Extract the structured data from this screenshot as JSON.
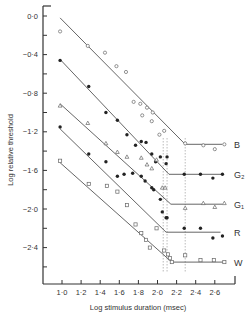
{
  "chart_data": {
    "type": "scatter",
    "title": "",
    "xlabel": "Log stimulus duration (msec)",
    "ylabel": "Log relative threshold",
    "xlim": [
      0.82,
      2.78
    ],
    "ylim": [
      -2.72,
      0.05
    ],
    "x_ticks": [
      "1·0",
      "1·2",
      "1·4",
      "1·6",
      "1·8",
      "2·0",
      "2·2",
      "2·4",
      "2·6"
    ],
    "x_tick_values": [
      1.0,
      1.2,
      1.4,
      1.6,
      1.8,
      2.0,
      2.2,
      2.4,
      2.6
    ],
    "y_ticks": [
      "0·0",
      "−0·4",
      "−0·8",
      "−1·2",
      "−1·6",
      "−2·0",
      "−2·4"
    ],
    "y_tick_values": [
      0.0,
      -0.4,
      -0.8,
      -1.2,
      -1.6,
      -2.0,
      -2.4
    ],
    "grid": false,
    "legend_position": "right, inline labels",
    "reference_lines_x": [
      2.06,
      2.1,
      2.29
    ],
    "series": [
      {
        "name": "B",
        "marker": "open-circle",
        "knee": [
          2.29,
          -1.33
        ],
        "fit_start": [
          0.98,
          -0.02
        ],
        "fit_end": [
          2.68,
          -1.33
        ],
        "points": [
          [
            0.98,
            -0.16
          ],
          [
            1.27,
            -0.31
          ],
          [
            1.45,
            -0.38
          ],
          [
            1.57,
            -0.52
          ],
          [
            1.67,
            -0.58
          ],
          [
            1.75,
            -0.89
          ],
          [
            1.82,
            -0.91
          ],
          [
            1.89,
            -0.95
          ],
          [
            1.95,
            -1.0
          ],
          [
            1.84,
            -1.03
          ],
          [
            1.94,
            -1.09
          ],
          [
            2.02,
            -1.23
          ],
          [
            2.07,
            -1.19
          ],
          [
            2.29,
            -1.32
          ],
          [
            2.48,
            -1.34
          ],
          [
            2.6,
            -1.38
          ],
          [
            2.7,
            -1.33
          ]
        ]
      },
      {
        "name": "G₂",
        "marker": "filled-circle",
        "knee": [
          2.12,
          -1.64
        ],
        "fit_start": [
          0.98,
          -0.45
        ],
        "fit_end": [
          2.68,
          -1.64
        ],
        "points": [
          [
            0.98,
            -0.46
          ],
          [
            1.28,
            -0.73
          ],
          [
            1.46,
            -1.0
          ],
          [
            1.58,
            -1.08
          ],
          [
            1.68,
            -1.23
          ],
          [
            1.77,
            -1.34
          ],
          [
            1.83,
            -1.3
          ],
          [
            1.88,
            -1.31
          ],
          [
            1.94,
            -1.43
          ],
          [
            1.98,
            -1.51
          ],
          [
            2.03,
            -1.46
          ],
          [
            2.1,
            -1.46
          ],
          [
            2.09,
            -1.53
          ],
          [
            2.28,
            -1.64
          ],
          [
            2.45,
            -1.64
          ],
          [
            2.58,
            -1.68
          ],
          [
            2.68,
            -1.64
          ]
        ]
      },
      {
        "name": "G₁",
        "marker": "open-triangle",
        "knee": [
          2.14,
          -1.95
        ],
        "fit_start": [
          0.98,
          -0.91
        ],
        "fit_end": [
          2.68,
          -1.95
        ],
        "points": [
          [
            0.98,
            -0.93
          ],
          [
            1.27,
            -1.11
          ],
          [
            1.46,
            -1.32
          ],
          [
            1.58,
            -1.41
          ],
          [
            1.68,
            -1.46
          ],
          [
            1.83,
            -1.47
          ],
          [
            1.89,
            -1.54
          ],
          [
            1.94,
            -1.58
          ],
          [
            1.99,
            -1.49
          ],
          [
            2.05,
            -1.78
          ],
          [
            2.08,
            -1.78
          ],
          [
            2.29,
            -1.99
          ],
          [
            2.48,
            -1.94
          ],
          [
            2.6,
            -1.98
          ],
          [
            2.7,
            -1.94
          ]
        ]
      },
      {
        "name": "R",
        "marker": "filled-circle",
        "knee": [
          2.09,
          -2.24
        ],
        "fit_start": [
          0.98,
          -1.17
        ],
        "fit_end": [
          2.66,
          -2.24
        ],
        "points": [
          [
            0.98,
            -1.15
          ],
          [
            1.28,
            -1.43
          ],
          [
            1.46,
            -1.51
          ],
          [
            1.58,
            -1.66
          ],
          [
            1.65,
            -1.64
          ],
          [
            1.74,
            -1.63
          ],
          [
            1.83,
            -1.66
          ],
          [
            1.87,
            -1.71
          ],
          [
            1.94,
            -1.78
          ],
          [
            1.96,
            -1.8
          ],
          [
            2.03,
            -1.9
          ],
          [
            2.05,
            -2.03
          ],
          [
            2.09,
            -2.09
          ],
          [
            2.1,
            -2.09
          ],
          [
            2.28,
            -2.2
          ],
          [
            2.45,
            -2.2
          ],
          [
            2.58,
            -2.3
          ],
          [
            2.68,
            -2.28
          ]
        ]
      },
      {
        "name": "W",
        "marker": "open-square",
        "knee": [
          2.15,
          -2.55
        ],
        "fit_start": [
          0.98,
          -1.52
        ],
        "fit_end": [
          2.7,
          -2.55
        ],
        "points": [
          [
            0.98,
            -1.5
          ],
          [
            1.28,
            -1.74
          ],
          [
            1.47,
            -1.76
          ],
          [
            1.58,
            -1.82
          ],
          [
            1.68,
            -1.96
          ],
          [
            1.77,
            -2.16
          ],
          [
            1.83,
            -2.25
          ],
          [
            1.88,
            -2.32
          ],
          [
            1.99,
            -2.2
          ],
          [
            1.92,
            -2.4
          ],
          [
            2.07,
            -2.43
          ],
          [
            2.11,
            -2.47
          ],
          [
            2.13,
            -2.51
          ],
          [
            2.15,
            -2.55
          ],
          [
            2.29,
            -2.48
          ],
          [
            2.45,
            -2.53
          ],
          [
            2.59,
            -2.53
          ],
          [
            2.7,
            -2.55
          ]
        ]
      }
    ]
  },
  "axes": {
    "xlabel": "Log stimulus duration (msec)",
    "ylabel": "Log relative threshold"
  }
}
